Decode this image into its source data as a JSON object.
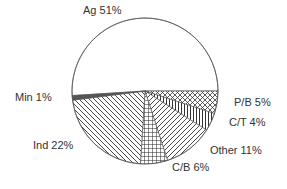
{
  "chart_data": {
    "type": "pie",
    "title": "",
    "categories": [
      "Ag",
      "P/B",
      "C/T",
      "Other",
      "C/B",
      "Ind",
      "Min"
    ],
    "values": [
      51,
      5,
      4,
      11,
      6,
      22,
      1
    ],
    "labels": [
      "Ag 51%",
      "P/B 5%",
      "C/T 4%",
      "Other 11%",
      "C/B 6%",
      "Ind 22%",
      "Min 1%"
    ],
    "fills": [
      "none",
      "crosshatch-diagonal",
      "vertical-lines",
      "diagonal-lines-right",
      "grid",
      "diagonal-lines-left",
      "solid-thin"
    ],
    "legend": "none",
    "start_angle": "3 o'clock, Ag counter-clockwise over top"
  },
  "colors": {
    "stroke": "#333333",
    "background": "#ffffff"
  }
}
